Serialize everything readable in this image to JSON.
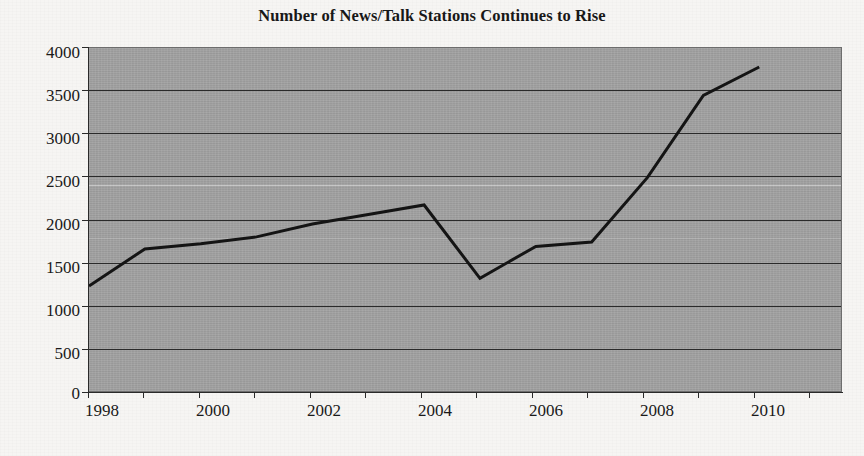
{
  "chart_data": {
    "type": "line",
    "title": "Number of News/Talk Stations Continues to Rise",
    "xlabel": "",
    "ylabel": "",
    "x": [
      1998,
      1999,
      2000,
      2001,
      2002,
      2003,
      2004,
      2005,
      2006,
      2007,
      2008,
      2009,
      2010
    ],
    "values": [
      1240,
      1670,
      1730,
      1810,
      1960,
      2070,
      2180,
      1330,
      1700,
      1750,
      2500,
      3450,
      3780
    ],
    "series": [
      {
        "name": "News/Talk Stations",
        "values": [
          1240,
          1670,
          1730,
          1810,
          1960,
          2070,
          2180,
          1330,
          1700,
          1750,
          2500,
          3450,
          3780
        ]
      }
    ],
    "xlim": [
      1998,
      2011.5
    ],
    "ylim": [
      0,
      4000
    ],
    "ytick_labels": [
      "4000",
      "3500",
      "3000",
      "2500",
      "2000",
      "1500",
      "1000",
      "500",
      "0"
    ],
    "ytick_values": [
      4000,
      3500,
      3000,
      2500,
      2000,
      1500,
      1000,
      500,
      0
    ],
    "xtick_labels": [
      "1998",
      "2000",
      "2002",
      "2004",
      "2006",
      "2008",
      "2010"
    ],
    "xtick_values": [
      1998,
      2000,
      2002,
      2004,
      2006,
      2008,
      2010
    ],
    "xminor_values": [
      1999,
      2001,
      2003,
      2005,
      2007,
      2009,
      2011
    ],
    "grid": true,
    "legend": null,
    "legend_position": "none",
    "colors": {
      "plot_background": "#a3a3a3",
      "page_background": "#f6f5f3",
      "line": "#141414",
      "gridline": "#2a2a2a",
      "text": "#1a1a1a"
    },
    "line_width": 3
  }
}
